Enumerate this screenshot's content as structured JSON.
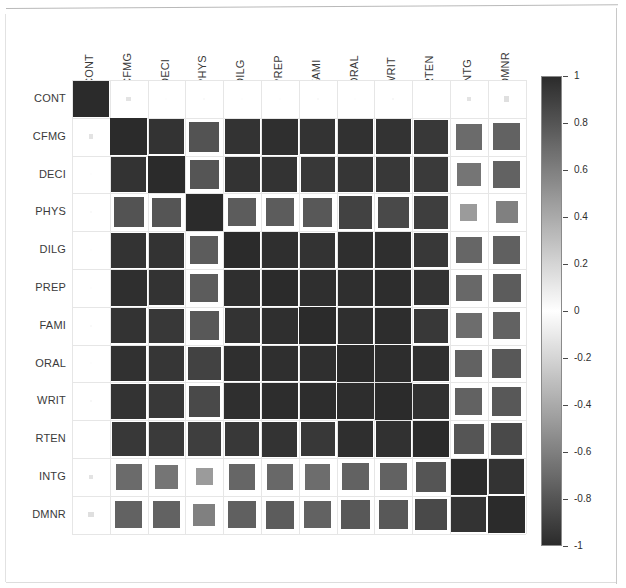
{
  "figure": {
    "type": "correlation-matrix-heatmap",
    "background": "#ffffff",
    "frame_color": "#c8c8c8",
    "grid_color": "#e6e6e6",
    "label_color": "#3a3a3a"
  },
  "colorbar": {
    "name": "correlation-colorbar",
    "orientation": "vertical",
    "min": -1,
    "max": 1,
    "tick_labels": [
      "1",
      "0.8",
      "0.6",
      "0.4",
      "0.2",
      "0",
      "-0.2",
      "-0.4",
      "-0.6",
      "-0.8",
      "-1"
    ],
    "tick_values": [
      1,
      0.8,
      0.6,
      0.4,
      0.2,
      0,
      -0.2,
      -0.4,
      -0.6,
      -0.8,
      -1
    ],
    "colormap": "grayscale-diverging",
    "color_high": "#2b2b2b",
    "color_mid": "#ffffff",
    "color_low": "#2b2b2b"
  },
  "chart_data": {
    "type": "heatmap",
    "title": "",
    "xlabel": "",
    "ylabel": "",
    "grid": true,
    "legend_position": "right",
    "zlim": [
      -1,
      1
    ],
    "colormap": "grayscale-diverging",
    "shape": "square-scaled-by-magnitude",
    "categories": [
      "CONT",
      "CFMG",
      "DECI",
      "PHYS",
      "DILG",
      "PREP",
      "FAMI",
      "ORAL",
      "WRIT",
      "RTEN",
      "INTG",
      "DMNR"
    ],
    "x_tick_labels": [
      "CONT",
      "CFMG",
      "DECI",
      "PHYS",
      "DILG",
      "PREP",
      "FAMI",
      "ORAL",
      "WRIT",
      "RTEN",
      "INTG",
      "DMNR"
    ],
    "y_tick_labels": [
      "CONT",
      "CFMG",
      "DECI",
      "PHYS",
      "DILG",
      "PREP",
      "FAMI",
      "ORAL",
      "WRIT",
      "RTEN",
      "INTG",
      "DMNR"
    ],
    "matrix": [
      [
        1.0,
        0.13,
        0.01,
        -0.03,
        -0.01,
        0.01,
        -0.03,
        -0.01,
        -0.04,
        0.0,
        -0.13,
        -0.15
      ],
      [
        0.13,
        1.0,
        0.96,
        0.81,
        0.96,
        0.98,
        0.96,
        0.97,
        0.96,
        0.94,
        0.7,
        0.74
      ],
      [
        0.01,
        0.96,
        1.0,
        0.8,
        0.96,
        0.96,
        0.94,
        0.95,
        0.94,
        0.93,
        0.65,
        0.74
      ],
      [
        -0.03,
        0.81,
        0.8,
        1.0,
        0.77,
        0.77,
        0.79,
        0.89,
        0.86,
        0.91,
        0.47,
        0.6
      ],
      [
        -0.01,
        0.96,
        0.96,
        0.77,
        1.0,
        0.98,
        0.96,
        0.98,
        0.98,
        0.94,
        0.72,
        0.75
      ],
      [
        0.01,
        0.98,
        0.96,
        0.77,
        0.98,
        1.0,
        0.98,
        0.98,
        0.99,
        0.96,
        0.71,
        0.77
      ],
      [
        -0.03,
        0.96,
        0.94,
        0.79,
        0.96,
        0.98,
        1.0,
        0.98,
        0.99,
        0.94,
        0.69,
        0.74
      ],
      [
        -0.01,
        0.97,
        0.95,
        0.89,
        0.98,
        0.98,
        0.98,
        1.0,
        0.99,
        0.98,
        0.74,
        0.79
      ],
      [
        -0.04,
        0.96,
        0.94,
        0.86,
        0.98,
        0.99,
        0.99,
        0.99,
        1.0,
        0.97,
        0.74,
        0.79
      ],
      [
        0.0,
        0.94,
        0.93,
        0.91,
        0.94,
        0.96,
        0.94,
        0.98,
        0.97,
        1.0,
        0.8,
        0.86
      ],
      [
        -0.13,
        0.7,
        0.65,
        0.47,
        0.72,
        0.71,
        0.69,
        0.74,
        0.74,
        0.8,
        1.0,
        0.96
      ],
      [
        -0.15,
        0.74,
        0.74,
        0.6,
        0.75,
        0.77,
        0.74,
        0.79,
        0.79,
        0.86,
        0.96,
        1.0
      ]
    ]
  },
  "geometry": {
    "grid_left": 72,
    "grid_top": 80,
    "cell_size": 37.8,
    "n": 12,
    "colorbar_left": 541,
    "colorbar_top": 76,
    "colorbar_width": 21,
    "colorbar_height": 470
  }
}
